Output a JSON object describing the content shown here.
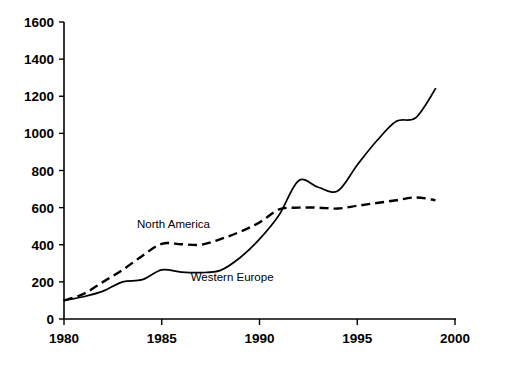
{
  "chart_data": {
    "type": "line",
    "title": "",
    "subtitle": "",
    "xlabel": "",
    "ylabel": "",
    "xlim": [
      1980,
      2000
    ],
    "ylim": [
      0,
      1600
    ],
    "grid": false,
    "legend_position": "inline-annotations",
    "x_ticks": [
      "1980",
      "1985",
      "1990",
      "1995",
      "2000"
    ],
    "x_tick_values": [
      1980,
      1985,
      1990,
      1995,
      2000
    ],
    "y_ticks": [
      "0",
      "200",
      "400",
      "600",
      "800",
      "1000",
      "1200",
      "1400",
      "1600"
    ],
    "y_tick_values": [
      0,
      200,
      400,
      600,
      800,
      1000,
      1200,
      1400,
      1600
    ],
    "x": [
      1980,
      1981,
      1982,
      1983,
      1984,
      1985,
      1986,
      1987,
      1988,
      1989,
      1990,
      1991,
      1992,
      1993,
      1994,
      1995,
      1996,
      1997,
      1998,
      1999
    ],
    "series": [
      {
        "name": "Western Europe",
        "style": "solid",
        "values": [
          100,
          120,
          150,
          200,
          212,
          265,
          253,
          250,
          262,
          330,
          430,
          560,
          745,
          710,
          690,
          830,
          960,
          1065,
          1085,
          1240
        ]
      },
      {
        "name": "North America",
        "style": "dashed",
        "values": [
          100,
          135,
          200,
          265,
          340,
          405,
          403,
          400,
          430,
          470,
          520,
          590,
          600,
          600,
          595,
          610,
          625,
          640,
          655,
          640
        ]
      }
    ],
    "annotations": [
      {
        "text": "North America",
        "x": 1985.6,
        "y": 492
      },
      {
        "text": "Western Europe",
        "x": 1988.6,
        "y": 205
      }
    ]
  },
  "axis": {
    "y_axis_name": "y-axis",
    "x_axis_name": "x-axis"
  },
  "caption": {
    "text": ""
  }
}
